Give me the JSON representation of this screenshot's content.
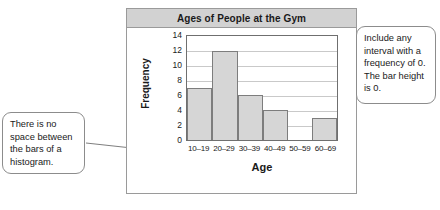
{
  "chart_data": {
    "type": "bar",
    "title": "Ages of People at the Gym",
    "xlabel": "Age",
    "ylabel": "Frequency",
    "categories": [
      "10–19",
      "20–29",
      "30–39",
      "40–49",
      "50–59",
      "60–69"
    ],
    "values": [
      7,
      12,
      6,
      4,
      0,
      3
    ],
    "ylim": [
      0,
      14
    ],
    "yticks": [
      14,
      12,
      10,
      8,
      6,
      4,
      2,
      0
    ],
    "grid": true,
    "legend": "none",
    "bar_fill": "#d6d6d6",
    "bar_stroke": "#7d7d7d",
    "title_bar_color": "#d2d2d2"
  },
  "annotations": {
    "left": {
      "text": "There is no space between the bars of a histogram.",
      "points_to": "base of first bar"
    },
    "right": {
      "text": "Include any interval with a frequency of 0. The bar height is 0.",
      "points_to": "50–59 zero-height bin"
    }
  }
}
